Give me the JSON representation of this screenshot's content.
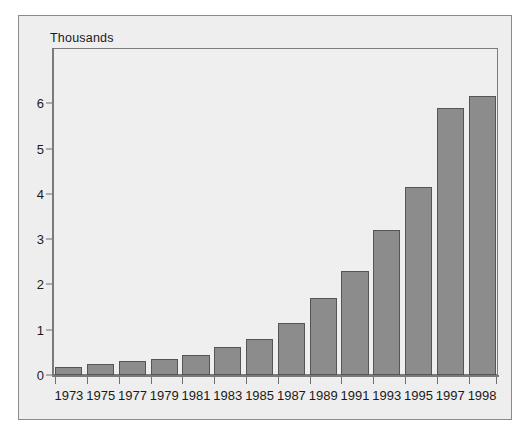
{
  "chart_data": {
    "type": "bar",
    "title": "Thousands",
    "xlabel": "",
    "ylabel": "",
    "categories": [
      "1973",
      "1975",
      "1977",
      "1979",
      "1981",
      "1983",
      "1985",
      "1987",
      "1989",
      "1991",
      "1993",
      "1995",
      "1997",
      "1998"
    ],
    "values": [
      0.17,
      0.24,
      0.3,
      0.35,
      0.44,
      0.62,
      0.8,
      1.15,
      1.7,
      2.3,
      3.2,
      4.15,
      5.9,
      6.15
    ],
    "series": [
      {
        "name": "Thousands",
        "values": [
          0.17,
          0.24,
          0.3,
          0.35,
          0.44,
          0.62,
          0.8,
          1.15,
          1.7,
          2.3,
          3.2,
          4.15,
          5.9,
          6.15
        ]
      }
    ],
    "ylim": [
      0,
      6.7
    ],
    "yticks": [
      0,
      1,
      2,
      3,
      4,
      5,
      6
    ],
    "ytick_labels": [
      "0",
      "1",
      "2",
      "3",
      "4",
      "5",
      "6"
    ],
    "grid": false,
    "legend": "none",
    "bar_color": "#8c8c8c",
    "bar_edge_color": "#555555",
    "plot_background": "#efefef",
    "figure_background": "#eeeeee",
    "axis_color": "#7a7a7a",
    "text_color": "#1a1a1a"
  }
}
